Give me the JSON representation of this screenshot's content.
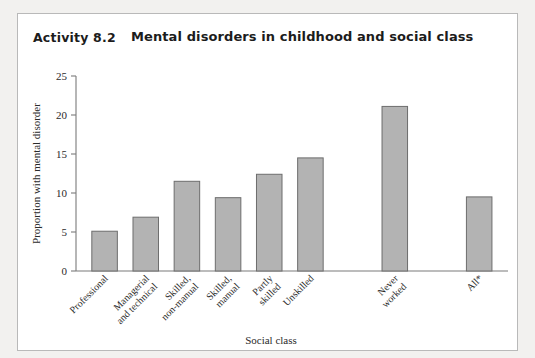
{
  "figure": {
    "activity_label": "Activity 8.2",
    "title": "Mental disorders in childhood and social class"
  },
  "chart_data": {
    "type": "bar",
    "title": "Mental disorders in childhood and social class",
    "xlabel": "Social class",
    "ylabel": "Proportion with mental disorder",
    "ylim": [
      0,
      25
    ],
    "yticks": [
      0,
      5,
      10,
      15,
      20,
      25
    ],
    "ytick_labels": [
      "0",
      "5",
      "10",
      "15",
      "20",
      "25"
    ],
    "grid": false,
    "legend": false,
    "categories": [
      "Professional",
      "Managerial and technical",
      "Skilled, non-manual",
      "Skilled, manual",
      "Partly skilled",
      "Unskilled",
      "Never worked",
      "All*"
    ],
    "category_label_lines": [
      [
        "Professional"
      ],
      [
        "Managerial",
        "and technical"
      ],
      [
        "Skilled,",
        "non-manual"
      ],
      [
        "Skilled,",
        "manual"
      ],
      [
        "Partly",
        "skilled"
      ],
      [
        "Unskilled"
      ],
      [
        "Never",
        "worked"
      ],
      [
        "All*"
      ]
    ],
    "values": [
      5.1,
      6.9,
      11.5,
      9.4,
      12.4,
      14.5,
      21.1,
      9.5
    ],
    "bar_color": "#b3b3b3",
    "bar_edge_color": "#6d6d6d"
  }
}
